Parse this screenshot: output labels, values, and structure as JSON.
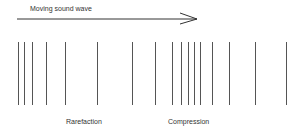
{
  "title": "Moving sound wave",
  "labels": {
    "rarefaction": "Rarefaction",
    "compression": "Compression"
  },
  "lines_x": [
    18,
    24,
    32,
    46,
    65,
    97,
    132,
    155,
    172,
    181,
    188,
    194,
    200,
    212,
    229,
    255,
    286
  ]
}
